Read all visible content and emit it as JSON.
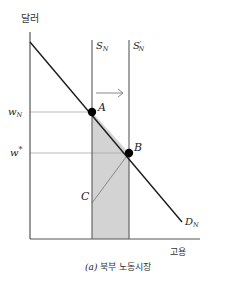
{
  "diagram": {
    "y_axis_label": "달러",
    "x_axis_label": "고용",
    "caption_prefix": "(a)",
    "caption_text": "북부 노동시장",
    "supply_label_main": "S",
    "supply_label_sub": "N",
    "supply_prime_label_main": "S",
    "supply_prime_label_sub": "N",
    "supply_prime_mark": "′",
    "demand_label_main": "D",
    "demand_label_sub": "N",
    "wage_high_label_main": "w",
    "wage_high_label_sub": "N",
    "wage_eq_label": "w",
    "wage_eq_mark": "*",
    "point_a": "A",
    "point_b": "B",
    "point_c": "C",
    "colors": {
      "axis": "#555555",
      "demand": "#1a1a1a",
      "supply": "#666666",
      "shade": "#d3d3d3",
      "guide": "#999999",
      "arrow": "#888888",
      "point": "#000000"
    }
  }
}
